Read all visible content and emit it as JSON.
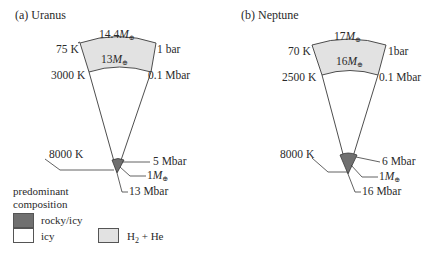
{
  "panels": [
    {
      "title": "(a) Uranus",
      "outer_mass": "14.4",
      "envelope_mass": "13",
      "core_mass": "1",
      "outer_temp": "75 K",
      "inner_temp": "3000 K",
      "core_temp": "8000 K",
      "outer_pressure": "1 bar",
      "inner_pressure": "0.1 Mbar",
      "core_top_pressure": "5 Mbar",
      "center_pressure": "13 Mbar"
    },
    {
      "title": "(b) Neptune",
      "outer_mass": "17",
      "envelope_mass": "16",
      "core_mass": "1",
      "outer_temp": "70 K",
      "inner_temp": "2500 K",
      "core_temp": "8000 K",
      "outer_pressure": "1bar",
      "inner_pressure": "0.1 Mbar",
      "core_top_pressure": "6 Mbar",
      "center_pressure": "16 Mbar"
    }
  ],
  "mass_unit_symbol": "M",
  "earth_symbol": "⊕",
  "legend": {
    "heading_line1": "predominant",
    "heading_line2": "composition",
    "items": [
      {
        "label": "rocky/icy",
        "color": "#707070"
      },
      {
        "label": "icy",
        "color": "#ffffff"
      },
      {
        "label_main": "H",
        "label_sub": "2",
        "label_rest": " + He",
        "color": "#e2e2e2"
      }
    ]
  },
  "colors": {
    "envelope": "#e2e2e2",
    "core": "#707070",
    "line": "#3a3a3a"
  }
}
